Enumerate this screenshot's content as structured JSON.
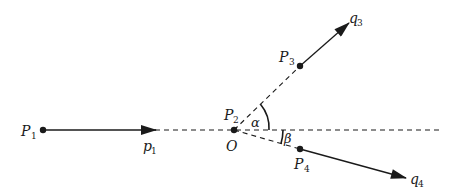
{
  "diagram": {
    "type": "particle collision / momentum diagram",
    "colors": {
      "stroke": "#1a1a1a",
      "background": "#ffffff"
    },
    "points": [
      {
        "id": "P1",
        "label": "P",
        "sub": "1",
        "x": 43,
        "y": 130
      },
      {
        "id": "O",
        "label": "O",
        "x": 234,
        "y": 130
      },
      {
        "id": "P2",
        "label": "P",
        "sub": "2"
      },
      {
        "id": "P3",
        "label": "P",
        "sub": "3",
        "x": 300,
        "y": 66
      },
      {
        "id": "P4",
        "label": "P",
        "sub": "4",
        "x": 300,
        "y": 149
      }
    ],
    "vectors": [
      {
        "id": "p1",
        "label": "p",
        "sub": "1",
        "from": "P1",
        "to": [
          155,
          130
        ]
      },
      {
        "id": "q3",
        "label": "q",
        "sub": "3",
        "from": "P3",
        "to": [
          348,
          24
        ]
      },
      {
        "id": "q4",
        "label": "q",
        "sub": "4",
        "from": "P4",
        "to": [
          405,
          178
        ]
      }
    ],
    "angles": [
      {
        "id": "alpha",
        "label": "α",
        "between": [
          "O-P3",
          "horizontal"
        ]
      },
      {
        "id": "beta",
        "label": "β",
        "between": [
          "O-P4",
          "horizontal"
        ]
      }
    ],
    "labels": {
      "P1_main": "P",
      "P1_sub": "1",
      "p1_main": "p",
      "p1_sub": "1",
      "P2_main": "P",
      "P2_sub": "2",
      "O": "O",
      "P3_main": "P",
      "P3_sub": "3",
      "q3_main": "q",
      "q3_sub": "3",
      "P4_main": "P",
      "P4_sub": "4",
      "q4_main": "q",
      "q4_sub": "4",
      "alpha": "α",
      "beta": "β"
    }
  }
}
